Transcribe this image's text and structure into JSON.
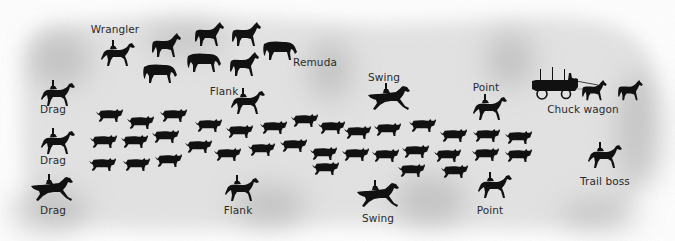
{
  "diagram": {
    "colors": {
      "background": "#ffffff",
      "field": "#e2e2e2",
      "field_shadow": "#b8b8b8",
      "silhouette": "#111111",
      "label": "#2a2a2a"
    },
    "labels": [
      {
        "id": "wrangler",
        "text": "Wrangler",
        "x": 115,
        "y": 24
      },
      {
        "id": "remuda",
        "text": "Remuda",
        "x": 315,
        "y": 57
      },
      {
        "id": "flank-top",
        "text": "Flank",
        "x": 224,
        "y": 86
      },
      {
        "id": "swing-top",
        "text": "Swing",
        "x": 384,
        "y": 72
      },
      {
        "id": "point-top",
        "text": "Point",
        "x": 486,
        "y": 82
      },
      {
        "id": "chuck-wagon",
        "text": "Chuck wagon",
        "x": 583,
        "y": 104
      },
      {
        "id": "drag-1",
        "text": "Drag",
        "x": 53,
        "y": 104
      },
      {
        "id": "drag-2",
        "text": "Drag",
        "x": 53,
        "y": 155
      },
      {
        "id": "drag-3",
        "text": "Drag",
        "x": 53,
        "y": 205
      },
      {
        "id": "flank-bottom",
        "text": "Flank",
        "x": 238,
        "y": 205
      },
      {
        "id": "swing-bottom",
        "text": "Swing",
        "x": 378,
        "y": 213
      },
      {
        "id": "point-bottom",
        "text": "Point",
        "x": 490,
        "y": 205
      },
      {
        "id": "trail-boss",
        "text": "Trail boss",
        "x": 605,
        "y": 176
      }
    ],
    "riders": [
      {
        "role": "Wrangler",
        "x": 100,
        "y": 38,
        "w": 36,
        "h": 30,
        "gait": "trot"
      },
      {
        "role": "Flank",
        "x": 230,
        "y": 86,
        "w": 36,
        "h": 30,
        "gait": "trot"
      },
      {
        "role": "Swing",
        "x": 367,
        "y": 82,
        "w": 44,
        "h": 30,
        "gait": "gallop"
      },
      {
        "role": "Point",
        "x": 472,
        "y": 92,
        "w": 36,
        "h": 30,
        "gait": "trot"
      },
      {
        "role": "Drag",
        "x": 40,
        "y": 78,
        "w": 36,
        "h": 30,
        "gait": "trot"
      },
      {
        "role": "Drag",
        "x": 40,
        "y": 126,
        "w": 36,
        "h": 30,
        "gait": "trot"
      },
      {
        "role": "Drag",
        "x": 30,
        "y": 172,
        "w": 44,
        "h": 32,
        "gait": "gallop"
      },
      {
        "role": "Flank",
        "x": 224,
        "y": 173,
        "w": 36,
        "h": 30,
        "gait": "trot"
      },
      {
        "role": "Swing",
        "x": 356,
        "y": 178,
        "w": 44,
        "h": 32,
        "gait": "gallop"
      },
      {
        "role": "Point",
        "x": 477,
        "y": 170,
        "w": 36,
        "h": 30,
        "gait": "trot"
      },
      {
        "role": "Trail boss",
        "x": 587,
        "y": 140,
        "w": 36,
        "h": 30,
        "gait": "trot"
      }
    ],
    "remuda_horses": [
      {
        "x": 150,
        "y": 33,
        "w": 32,
        "h": 26,
        "pose": "walk"
      },
      {
        "x": 193,
        "y": 22,
        "w": 32,
        "h": 26,
        "pose": "walk"
      },
      {
        "x": 230,
        "y": 22,
        "w": 32,
        "h": 26,
        "pose": "walk"
      },
      {
        "x": 262,
        "y": 40,
        "w": 36,
        "h": 22,
        "pose": "graze"
      },
      {
        "x": 142,
        "y": 63,
        "w": 36,
        "h": 22,
        "pose": "graze"
      },
      {
        "x": 186,
        "y": 52,
        "w": 36,
        "h": 22,
        "pose": "graze"
      },
      {
        "x": 228,
        "y": 52,
        "w": 32,
        "h": 26,
        "pose": "walk"
      }
    ],
    "cattle": [
      {
        "x": 96,
        "y": 108
      },
      {
        "x": 127,
        "y": 115
      },
      {
        "x": 160,
        "y": 108
      },
      {
        "x": 195,
        "y": 118
      },
      {
        "x": 226,
        "y": 124
      },
      {
        "x": 260,
        "y": 120
      },
      {
        "x": 291,
        "y": 113
      },
      {
        "x": 318,
        "y": 120
      },
      {
        "x": 344,
        "y": 125
      },
      {
        "x": 374,
        "y": 122
      },
      {
        "x": 409,
        "y": 118
      },
      {
        "x": 440,
        "y": 128
      },
      {
        "x": 473,
        "y": 128
      },
      {
        "x": 505,
        "y": 130
      },
      {
        "x": 90,
        "y": 134
      },
      {
        "x": 121,
        "y": 134
      },
      {
        "x": 152,
        "y": 129
      },
      {
        "x": 185,
        "y": 139
      },
      {
        "x": 214,
        "y": 147
      },
      {
        "x": 248,
        "y": 142
      },
      {
        "x": 280,
        "y": 138
      },
      {
        "x": 310,
        "y": 146
      },
      {
        "x": 342,
        "y": 147
      },
      {
        "x": 372,
        "y": 148
      },
      {
        "x": 402,
        "y": 144
      },
      {
        "x": 434,
        "y": 148
      },
      {
        "x": 472,
        "y": 147
      },
      {
        "x": 505,
        "y": 148
      },
      {
        "x": 89,
        "y": 157
      },
      {
        "x": 123,
        "y": 157
      },
      {
        "x": 155,
        "y": 153
      },
      {
        "x": 312,
        "y": 161
      },
      {
        "x": 398,
        "y": 163
      },
      {
        "x": 441,
        "y": 164
      }
    ],
    "wagon": {
      "x": 530,
      "y": 67,
      "w": 68,
      "h": 34
    },
    "wagon_team": [
      {
        "x": 577,
        "y": 80,
        "w": 34,
        "h": 22
      },
      {
        "x": 614,
        "y": 80,
        "w": 32,
        "h": 22
      }
    ]
  }
}
